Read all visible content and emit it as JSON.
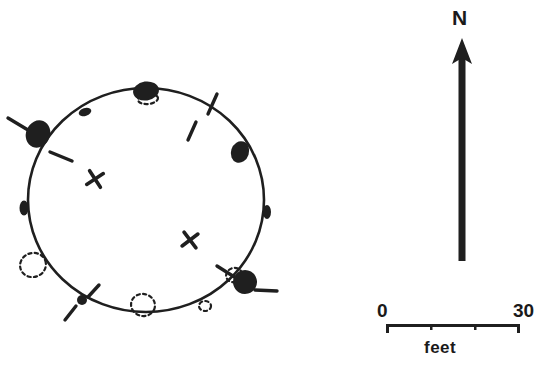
{
  "figure": {
    "kind": "archaeological-site-plan",
    "width": 556,
    "height": 372,
    "background_color": "#ffffff",
    "ink_color": "#1f1f1f"
  },
  "north_arrow": {
    "label": "N",
    "shaft_x": 462,
    "shaft_top_y": 48,
    "shaft_bottom_y": 261,
    "shaft_width": 7,
    "head_tip_y": 38,
    "head_half_width": 10,
    "head_height": 26
  },
  "scale_bar": {
    "min_label": "0",
    "max_label": "30",
    "units_label": "feet",
    "bar_left_x": 386,
    "bar_right_x": 520,
    "bar_y": 325,
    "bar_thickness": 3,
    "end_cap_height": 9,
    "tick_height": 6,
    "tick_fractions": [
      0.333,
      0.667
    ]
  },
  "structure": {
    "outline": {
      "center_x": 146,
      "center_y": 200,
      "radius_x": 118,
      "radius_y": 112,
      "stroke_width": 2.6,
      "description": "wall-line-circle"
    },
    "interior_marks": [
      {
        "name": "interior-feature-upper",
        "x": 95,
        "y": 179,
        "size": 7.5,
        "rotation": 12
      },
      {
        "name": "interior-feature-lower",
        "x": 190,
        "y": 240,
        "size": 7.5,
        "rotation": 8
      }
    ],
    "posts_solid": [
      {
        "name": "post-north",
        "x": 146,
        "y": 91,
        "rx": 13,
        "ry": 9.5,
        "rotation": -8
      },
      {
        "name": "post-northwest-large",
        "x": 38,
        "y": 134,
        "rx": 12,
        "ry": 14,
        "rotation": 22
      },
      {
        "name": "post-northeast",
        "x": 240,
        "y": 152,
        "rx": 9,
        "ry": 11,
        "rotation": 18
      },
      {
        "name": "post-southeast-large",
        "x": 245,
        "y": 282,
        "rx": 12,
        "ry": 12,
        "rotation": -15
      },
      {
        "name": "post-north-northwest-small",
        "x": 85,
        "y": 112,
        "rx": 6.5,
        "ry": 4,
        "rotation": -18
      },
      {
        "name": "post-west-small",
        "x": 24,
        "y": 208,
        "rx": 4.5,
        "ry": 7.5,
        "rotation": 0
      },
      {
        "name": "post-east-small",
        "x": 267,
        "y": 212,
        "rx": 4,
        "ry": 7,
        "rotation": 0
      },
      {
        "name": "post-south-small",
        "x": 82,
        "y": 300,
        "rx": 5,
        "ry": 5,
        "rotation": 0
      }
    ],
    "posts_dashed": [
      {
        "name": "inferred-post-southwest",
        "cx": 33,
        "cy": 265,
        "rx": 13,
        "ry": 12
      },
      {
        "name": "inferred-post-south-center",
        "cx": 143,
        "cy": 305,
        "rx": 12,
        "ry": 11
      },
      {
        "name": "inferred-post-south-east",
        "cx": 205,
        "cy": 306,
        "rx": 6,
        "ry": 5
      },
      {
        "name": "inferred-post-north-under",
        "cx": 148,
        "cy": 99,
        "rx": 10,
        "ry": 5
      },
      {
        "name": "inferred-post-southeast-under",
        "cx": 234,
        "cy": 275,
        "rx": 8,
        "ry": 7
      }
    ],
    "tick_marks": [
      {
        "name": "tick-northwest-outer",
        "x1": 8,
        "y1": 118,
        "x2": 28,
        "y2": 130
      },
      {
        "name": "tick-northwest-inner",
        "x1": 50,
        "y1": 152,
        "x2": 72,
        "y2": 161
      },
      {
        "name": "tick-northeast-upper",
        "x1": 217,
        "y1": 94,
        "x2": 208,
        "y2": 114
      },
      {
        "name": "tick-northeast-lower",
        "x1": 196,
        "y1": 122,
        "x2": 188,
        "y2": 140
      },
      {
        "name": "tick-southeast-upper",
        "x1": 217,
        "y1": 266,
        "x2": 236,
        "y2": 278
      },
      {
        "name": "tick-southeast-lower",
        "x1": 255,
        "y1": 290,
        "x2": 277,
        "y2": 291
      },
      {
        "name": "tick-south-upper",
        "x1": 99,
        "y1": 285,
        "x2": 88,
        "y2": 297
      },
      {
        "name": "tick-south-lower",
        "x1": 76,
        "y1": 306,
        "x2": 65,
        "y2": 320
      }
    ]
  }
}
